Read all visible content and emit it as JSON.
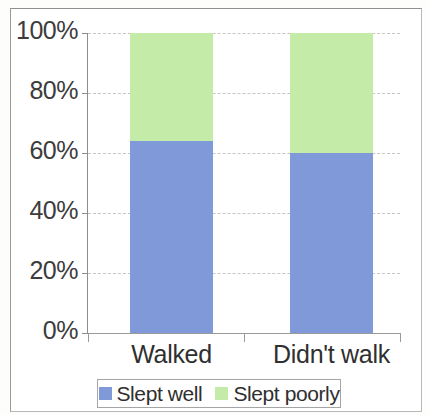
{
  "chart_data": {
    "type": "bar",
    "subtype": "100% stacked bar",
    "title": "",
    "xlabel": "",
    "ylabel": "",
    "categories": [
      "Walked",
      "Didn't walk"
    ],
    "series": [
      {
        "name": "Slept well",
        "color": "#8099d8",
        "values": [
          64,
          60
        ]
      },
      {
        "name": "Slept poorly",
        "color": "#c5eba8",
        "values": [
          36,
          40
        ]
      }
    ],
    "ylim": [
      0,
      100
    ],
    "yticks": [
      0,
      20,
      40,
      60,
      80,
      100
    ],
    "ytick_labels": [
      "0%",
      "20%",
      "40%",
      "60%",
      "80%",
      "100%"
    ],
    "grid": true,
    "legend_position": "bottom"
  },
  "axis": {
    "y": {
      "labels": [
        {
          "value": 100,
          "text": "100%"
        },
        {
          "value": 80,
          "text": "80%"
        },
        {
          "value": 60,
          "text": "60%"
        },
        {
          "value": 40,
          "text": "40%"
        },
        {
          "value": 20,
          "text": "20%"
        },
        {
          "value": 0,
          "text": "0%"
        }
      ]
    },
    "x": {
      "labels": [
        {
          "text": "Walked"
        },
        {
          "text": "Didn't walk"
        }
      ]
    }
  },
  "legend": {
    "entries": [
      {
        "label": "Slept well",
        "color": "#8099d8"
      },
      {
        "label": "Slept poorly",
        "color": "#c5eba8"
      }
    ]
  },
  "colors": {
    "slept_well": "#8099d8",
    "slept_poorly": "#c5eba8",
    "gridline": "#c6c6c6",
    "axis": "#8d8d8d",
    "text": "#2f2f2f"
  }
}
